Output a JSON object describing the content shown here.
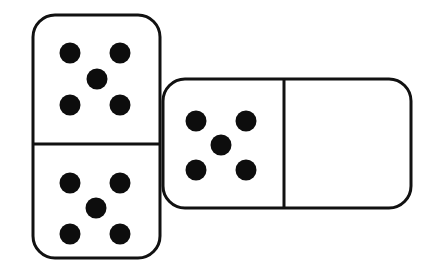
{
  "scene": {
    "title": "Two dominoes",
    "width": 441,
    "height": 263,
    "background_color": "#ffffff",
    "stroke_color": "#111111",
    "pip_color": "#0d0d0d"
  },
  "dominoes": [
    {
      "name": "vertical-domino",
      "orientation": "vertical",
      "z_order": "front",
      "x": 33,
      "y": 15,
      "width": 127,
      "height": 243,
      "corner_radius": 22,
      "stroke_width": 3,
      "divider": {
        "orientation": "horizontal",
        "position": 144
      },
      "halves": [
        {
          "name": "vertical-domino-top-half",
          "pip_count": 5,
          "pattern": "quincunx",
          "pips": [
            {
              "cx": 70,
              "cy": 53
            },
            {
              "cx": 120,
              "cy": 53
            },
            {
              "cx": 97,
              "cy": 79
            },
            {
              "cx": 70,
              "cy": 105
            },
            {
              "cx": 120,
              "cy": 105
            }
          ]
        },
        {
          "name": "vertical-domino-bottom-half",
          "pip_count": 5,
          "pattern": "quincunx",
          "pips": [
            {
              "cx": 70,
              "cy": 183
            },
            {
              "cx": 120,
              "cy": 183
            },
            {
              "cx": 96,
              "cy": 208
            },
            {
              "cx": 70,
              "cy": 234
            },
            {
              "cx": 120,
              "cy": 234
            }
          ]
        }
      ]
    },
    {
      "name": "horizontal-domino",
      "orientation": "horizontal",
      "z_order": "back",
      "x": 163,
      "y": 79,
      "width": 248,
      "height": 129,
      "corner_radius": 22,
      "stroke_width": 3,
      "divider": {
        "orientation": "vertical",
        "position": 284
      },
      "halves": [
        {
          "name": "horizontal-domino-left-half",
          "pip_count": 5,
          "pattern": "quincunx",
          "pips": [
            {
              "cx": 196,
              "cy": 121
            },
            {
              "cx": 246,
              "cy": 121
            },
            {
              "cx": 221,
              "cy": 145
            },
            {
              "cx": 196,
              "cy": 170
            },
            {
              "cx": 246,
              "cy": 170
            }
          ]
        },
        {
          "name": "horizontal-domino-right-half",
          "pip_count": 0,
          "pattern": "blank",
          "pips": []
        }
      ]
    }
  ],
  "pip_radius": 10.5
}
